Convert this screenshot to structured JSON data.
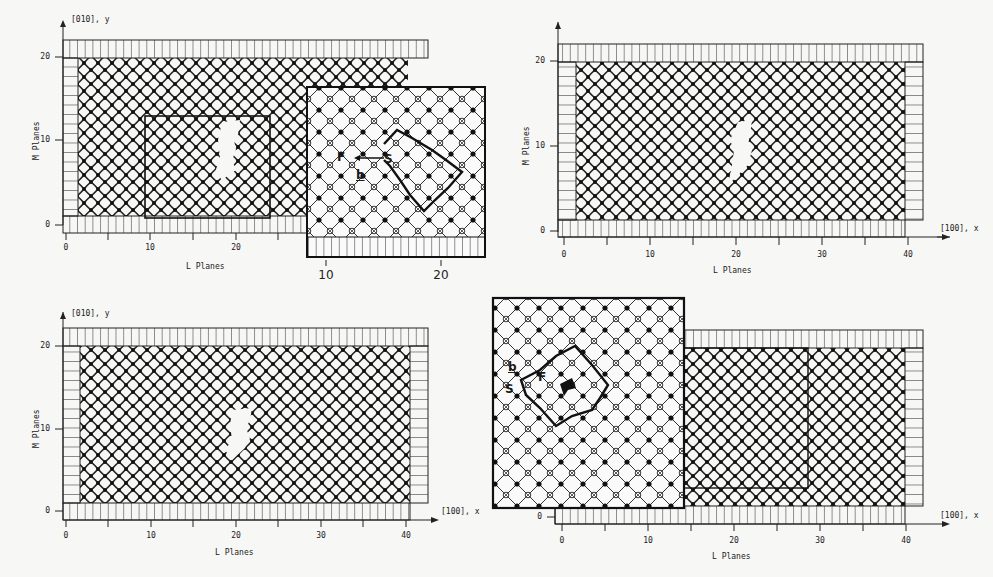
{
  "figure": {
    "panels": [
      {
        "id": "top-left",
        "y_axis_label": "[010], y",
        "x_axis_title": "L Planes",
        "y_axis_title": "M Planes",
        "y_ticks": [
          "0",
          "10",
          "20"
        ],
        "x_ticks": [
          "0",
          "10",
          "20"
        ],
        "inset": {
          "x_ticks": [
            "10",
            "20"
          ],
          "burgers_labels": {
            "finish": "F",
            "start": "S",
            "burgers": "b"
          }
        }
      },
      {
        "id": "top-right",
        "x_axis_label": "[100], x",
        "x_axis_title": "L Planes",
        "y_axis_title": "M Planes",
        "y_ticks": [
          "0",
          "10",
          "20"
        ],
        "x_ticks": [
          "0",
          "10",
          "20",
          "30",
          "40"
        ]
      },
      {
        "id": "bottom-left",
        "y_axis_label": "[010], y",
        "x_axis_label": "[100], x",
        "x_axis_title": "L Planes",
        "y_axis_title": "M Planes",
        "y_ticks": [
          "0",
          "10",
          "20"
        ],
        "x_ticks": [
          "0",
          "10",
          "20",
          "30",
          "40"
        ]
      },
      {
        "id": "bottom-right",
        "x_axis_label": "[100], x",
        "x_axis_title": "L Planes",
        "y_ticks": [
          "0"
        ],
        "x_ticks": [
          "0",
          "10",
          "20",
          "30",
          "40"
        ],
        "inset": {
          "burgers_labels": {
            "finish": "F",
            "start": "S",
            "burgers": "b"
          }
        }
      }
    ]
  }
}
